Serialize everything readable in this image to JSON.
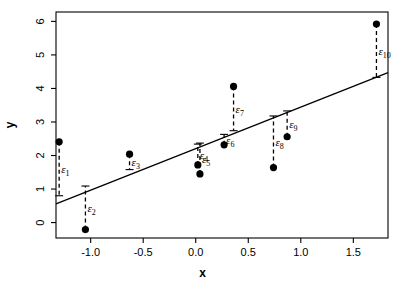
{
  "chart_data": {
    "type": "scatter",
    "title": "",
    "subtitle": "",
    "xlabel": "x",
    "ylabel": "y",
    "xlim": [
      -1.33,
      1.83
    ],
    "ylim": [
      -0.46,
      6.28
    ],
    "grid": false,
    "legend": "none",
    "xticks": [
      "-1.0",
      "-0.5",
      "0.0",
      "0.5",
      "1.0",
      "1.5"
    ],
    "xtick_values": [
      -1.0,
      -0.5,
      0.0,
      0.5,
      1.0,
      1.5
    ],
    "yticks": [
      "0",
      "1",
      "2",
      "3",
      "4",
      "5",
      "6"
    ],
    "ytick_values": [
      0,
      1,
      2,
      3,
      4,
      5,
      6
    ],
    "x": [
      -1.3,
      -1.05,
      -0.63,
      0.02,
      0.04,
      0.27,
      0.36,
      0.74,
      0.87,
      1.72
    ],
    "y": [
      2.41,
      -0.21,
      2.04,
      1.72,
      1.45,
      2.32,
      4.06,
      1.64,
      2.56,
      5.92
    ],
    "fit_line": {
      "label": "regression-line",
      "intercept": 1.82,
      "slope": 1.17,
      "x_start": -1.33,
      "x_end": 1.83,
      "y_start": 0.56,
      "y_end": 4.47
    },
    "residual_segments": [
      {
        "label": "ε",
        "sub": "1",
        "x": -1.3,
        "y_point": 2.41,
        "y_fit": 0.8
      },
      {
        "label": "ε",
        "sub": "2",
        "x": -1.05,
        "y_point": -0.21,
        "y_fit": 1.09
      },
      {
        "label": "ε",
        "sub": "3",
        "x": -0.63,
        "y_point": 2.04,
        "y_fit": 1.58
      },
      {
        "label": "ε",
        "sub": "4",
        "x": 0.02,
        "y_point": 1.72,
        "y_fit": 2.34
      },
      {
        "label": "ε",
        "sub": "5",
        "x": 0.04,
        "y_point": 1.45,
        "y_fit": 2.37
      },
      {
        "label": "ε",
        "sub": "6",
        "x": 0.27,
        "y_point": 2.32,
        "y_fit": 2.63
      },
      {
        "label": "ε",
        "sub": "7",
        "x": 0.36,
        "y_point": 4.06,
        "y_fit": 2.74
      },
      {
        "label": "ε",
        "sub": "8",
        "x": 0.74,
        "y_point": 1.64,
        "y_fit": 3.18
      },
      {
        "label": "ε",
        "sub": "9",
        "x": 0.87,
        "y_point": 2.56,
        "y_fit": 3.33
      },
      {
        "label": "ε",
        "sub": "10",
        "x": 1.72,
        "y_point": 5.92,
        "y_fit": 4.33
      }
    ],
    "point_color": "#000000",
    "line_color": "#000000",
    "residual_color": "#000000",
    "axis_color": "#000000",
    "background": "#ffffff"
  }
}
